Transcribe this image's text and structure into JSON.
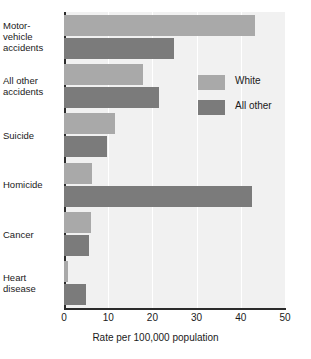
{
  "chart_data": {
    "type": "bar",
    "orientation": "horizontal",
    "title": "",
    "xlabel": "Rate per 100,000 population",
    "ylabel": "",
    "xlim": [
      0,
      50
    ],
    "xticks": [
      0,
      10,
      20,
      30,
      40,
      50
    ],
    "xtick_labels": [
      "0",
      "10",
      "20",
      "30",
      "40",
      "50"
    ],
    "grid": true,
    "grid_axis": "x",
    "legend_position": "upper right inside",
    "categories": [
      "Motor-vehicle accidents",
      "All other accidents",
      "Suicide",
      "Homicide",
      "Cancer",
      "Heart disease"
    ],
    "category_label_lines": [
      [
        "Motor-",
        "vehicle",
        "accidents"
      ],
      [
        "All other",
        "accidents"
      ],
      [
        "Suicide"
      ],
      [
        "Homicide"
      ],
      [
        "Cancer"
      ],
      [
        "Heart",
        "disease"
      ]
    ],
    "series": [
      {
        "name": "White",
        "color": "#a9a9a9",
        "values": [
          43.2,
          17.9,
          11.5,
          6.4,
          6.2,
          1.0
        ]
      },
      {
        "name": "All other",
        "color": "#7b7b7b",
        "values": [
          24.9,
          21.5,
          9.8,
          42.5,
          5.6,
          5.0
        ]
      }
    ]
  },
  "colors": {
    "white_series": "#a9a9a9",
    "allother_series": "#7b7b7b",
    "plot_background": "#f1f1f1",
    "gridline": "#ffffff",
    "axis": "#2b2b2b",
    "text": "#1a1a1a"
  }
}
